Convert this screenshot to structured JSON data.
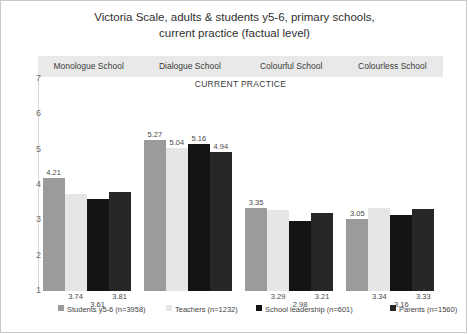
{
  "chart_data": {
    "type": "bar",
    "title": "Victoria Scale, adults & students y5-6, primary schools, current practice (factual level)",
    "title_lines": [
      "Victoria Scale, adults & students y5-6, primary schools,",
      "current practice (factual level)"
    ],
    "subtitle": "CURRENT PRACTICE",
    "xlabel": "",
    "ylabel": "",
    "ylim": [
      1,
      7
    ],
    "yticks": [
      7,
      6,
      5,
      4,
      3,
      2,
      1
    ],
    "grid": false,
    "legend_position": "bottom",
    "categories": [
      "Monologue School",
      "Dialogue School",
      "Colourful School",
      "Colourless School"
    ],
    "series": [
      {
        "name": "Students y5-6 (n=3958)",
        "color": "#9b9b9b",
        "values": [
          4.21,
          5.27,
          3.35,
          3.05
        ]
      },
      {
        "name": "Teachers (n=1232)",
        "color": "#e6e6e6",
        "values": [
          3.74,
          5.04,
          3.29,
          3.34
        ]
      },
      {
        "name": "School leadership (n=601)",
        "color": "#141414",
        "values": [
          3.61,
          5.16,
          2.98,
          3.16
        ]
      },
      {
        "name": "Parents (n=1560)",
        "color": "#272727",
        "values": [
          3.81,
          4.94,
          3.21,
          3.33
        ]
      }
    ],
    "value_labels": [
      [
        "4.21",
        "3.74",
        "3.61",
        "3.81"
      ],
      [
        "5.27",
        "5.04",
        "5.16",
        "4.94"
      ],
      [
        "3.35",
        "3.29",
        "2.98",
        "3.21"
      ],
      [
        "3.05",
        "3.34",
        "3.16",
        "3.33"
      ]
    ]
  },
  "legend": {
    "items": [
      {
        "label": "Students y5-6 (n=3958)",
        "color": "#9b9b9b"
      },
      {
        "label": "Teachers (n=1232)",
        "color": "#e6e6e6"
      },
      {
        "label": "School leadership (n=601)",
        "color": "#141414"
      },
      {
        "label": "Parents (n=1560)",
        "color": "#272727"
      }
    ]
  }
}
